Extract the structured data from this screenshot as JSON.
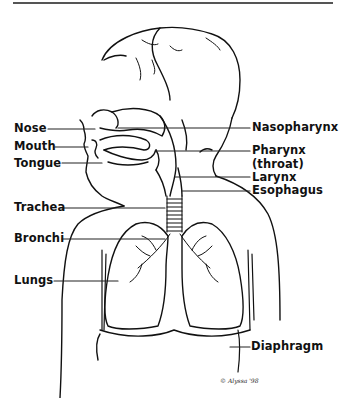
{
  "figure": {
    "credit": "© Alyssa '98"
  },
  "labels": {
    "left": [
      {
        "id": "nose",
        "text": "Nose"
      },
      {
        "id": "mouth",
        "text": "Mouth"
      },
      {
        "id": "tongue",
        "text": "Tongue"
      },
      {
        "id": "trachea",
        "text": "Trachea"
      },
      {
        "id": "bronchi",
        "text": "Bronchi"
      },
      {
        "id": "lungs",
        "text": "Lungs"
      }
    ],
    "right": [
      {
        "id": "nasopharynx",
        "text": "Nasopharynx"
      },
      {
        "id": "pharynx",
        "text": "Pharynx"
      },
      {
        "id": "pharynx_sub",
        "text": "(throat)"
      },
      {
        "id": "larynx",
        "text": "Larynx"
      },
      {
        "id": "esophagus",
        "text": "Esophagus"
      },
      {
        "id": "diaphragm",
        "text": "Diaphragm"
      }
    ]
  },
  "colors": {
    "ink": "#111111",
    "background": "#ffffff",
    "rule": "#555555"
  }
}
